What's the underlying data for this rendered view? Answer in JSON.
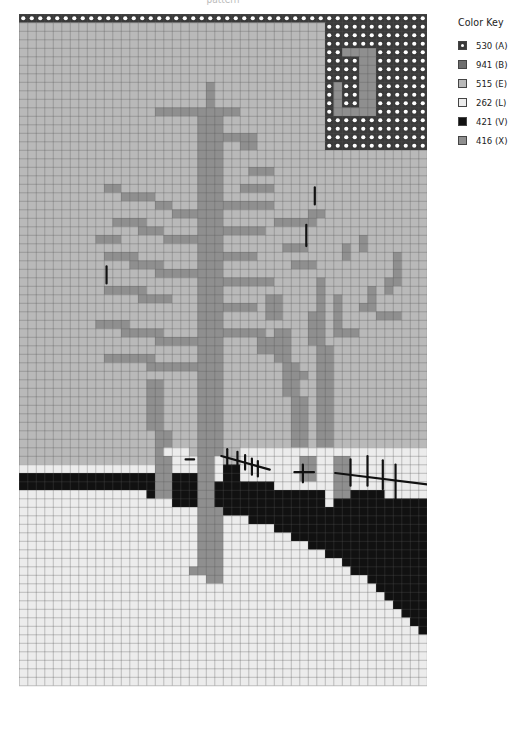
{
  "caption": "pattern",
  "legend": {
    "title": "Color Key",
    "items": [
      {
        "code": "A",
        "label": "530 (A)",
        "color": "#3a3a3a",
        "dot": true
      },
      {
        "code": "B",
        "label": "941 (B)",
        "color": "#6e6e6e",
        "dot": false
      },
      {
        "code": "E",
        "label": "515 (E)",
        "color": "#b9b9b9",
        "dot": false
      },
      {
        "code": "L",
        "label": "262 (L)",
        "color": "#ececec",
        "dot": false
      },
      {
        "code": "V",
        "label": "421 (V)",
        "color": "#111111",
        "dot": false
      },
      {
        "code": "X",
        "label": "416 (X)",
        "color": "#8f8f8f",
        "dot": false
      }
    ]
  },
  "grid": {
    "cols": 48,
    "rows": 79,
    "cell": 8.5,
    "gridline_color": "#555555",
    "background_code": "E",
    "rects": [
      {
        "code": "A",
        "x": 0,
        "y": 0,
        "w": 48,
        "h": 1
      },
      {
        "code": "A",
        "x": 36,
        "y": 0,
        "w": 12,
        "h": 16
      },
      {
        "code": "X",
        "x": 40,
        "y": 4,
        "w": 2,
        "h": 8
      },
      {
        "code": "X",
        "x": 38,
        "y": 4,
        "w": 2,
        "h": 1
      },
      {
        "code": "X",
        "x": 37,
        "y": 8,
        "w": 1,
        "h": 4
      },
      {
        "code": "X",
        "x": 37,
        "y": 11,
        "w": 4,
        "h": 1
      },
      {
        "code": "X",
        "x": 22,
        "y": 8,
        "w": 1,
        "h": 2
      },
      {
        "code": "X",
        "x": 22,
        "y": 10,
        "w": 1,
        "h": 2
      },
      {
        "code": "X",
        "x": 16,
        "y": 11,
        "w": 10,
        "h": 1
      },
      {
        "code": "X",
        "x": 21,
        "y": 12,
        "w": 2,
        "h": 60
      },
      {
        "code": "X",
        "x": 23,
        "y": 12,
        "w": 1,
        "h": 50
      },
      {
        "code": "X",
        "x": 10,
        "y": 20,
        "w": 2,
        "h": 1
      },
      {
        "code": "X",
        "x": 12,
        "y": 21,
        "w": 4,
        "h": 1
      },
      {
        "code": "X",
        "x": 16,
        "y": 22,
        "w": 2,
        "h": 1
      },
      {
        "code": "X",
        "x": 18,
        "y": 23,
        "w": 3,
        "h": 1
      },
      {
        "code": "X",
        "x": 11,
        "y": 24,
        "w": 4,
        "h": 1
      },
      {
        "code": "X",
        "x": 14,
        "y": 25,
        "w": 3,
        "h": 1
      },
      {
        "code": "X",
        "x": 17,
        "y": 26,
        "w": 4,
        "h": 1
      },
      {
        "code": "X",
        "x": 9,
        "y": 26,
        "w": 3,
        "h": 1
      },
      {
        "code": "X",
        "x": 10,
        "y": 28,
        "w": 4,
        "h": 1
      },
      {
        "code": "X",
        "x": 13,
        "y": 29,
        "w": 4,
        "h": 1
      },
      {
        "code": "X",
        "x": 16,
        "y": 30,
        "w": 5,
        "h": 1
      },
      {
        "code": "X",
        "x": 10,
        "y": 32,
        "w": 5,
        "h": 1
      },
      {
        "code": "X",
        "x": 14,
        "y": 33,
        "w": 4,
        "h": 1
      },
      {
        "code": "X",
        "x": 9,
        "y": 36,
        "w": 4,
        "h": 1
      },
      {
        "code": "X",
        "x": 12,
        "y": 37,
        "w": 5,
        "h": 1
      },
      {
        "code": "X",
        "x": 16,
        "y": 38,
        "w": 5,
        "h": 1
      },
      {
        "code": "X",
        "x": 10,
        "y": 40,
        "w": 6,
        "h": 1
      },
      {
        "code": "X",
        "x": 15,
        "y": 41,
        "w": 6,
        "h": 1
      },
      {
        "code": "X",
        "x": 15,
        "y": 43,
        "w": 2,
        "h": 6
      },
      {
        "code": "X",
        "x": 16,
        "y": 49,
        "w": 2,
        "h": 3
      },
      {
        "code": "X",
        "x": 24,
        "y": 14,
        "w": 4,
        "h": 1
      },
      {
        "code": "X",
        "x": 26,
        "y": 15,
        "w": 2,
        "h": 1
      },
      {
        "code": "X",
        "x": 27,
        "y": 18,
        "w": 3,
        "h": 1
      },
      {
        "code": "X",
        "x": 26,
        "y": 20,
        "w": 4,
        "h": 1
      },
      {
        "code": "X",
        "x": 24,
        "y": 22,
        "w": 6,
        "h": 1
      },
      {
        "code": "X",
        "x": 24,
        "y": 25,
        "w": 5,
        "h": 1
      },
      {
        "code": "X",
        "x": 24,
        "y": 28,
        "w": 4,
        "h": 1
      },
      {
        "code": "X",
        "x": 24,
        "y": 31,
        "w": 6,
        "h": 1
      },
      {
        "code": "X",
        "x": 24,
        "y": 34,
        "w": 4,
        "h": 1
      },
      {
        "code": "X",
        "x": 24,
        "y": 37,
        "w": 5,
        "h": 1
      },
      {
        "code": "X",
        "x": 30,
        "y": 24,
        "w": 5,
        "h": 1
      },
      {
        "code": "X",
        "x": 34,
        "y": 23,
        "w": 2,
        "h": 1
      },
      {
        "code": "X",
        "x": 31,
        "y": 27,
        "w": 3,
        "h": 1
      },
      {
        "code": "X",
        "x": 32,
        "y": 29,
        "w": 3,
        "h": 1
      },
      {
        "code": "X",
        "x": 30,
        "y": 37,
        "w": 2,
        "h": 4
      },
      {
        "code": "X",
        "x": 31,
        "y": 41,
        "w": 2,
        "h": 4
      },
      {
        "code": "X",
        "x": 32,
        "y": 45,
        "w": 2,
        "h": 13
      },
      {
        "code": "X",
        "x": 35,
        "y": 31,
        "w": 1,
        "h": 4
      },
      {
        "code": "X",
        "x": 34,
        "y": 35,
        "w": 2,
        "h": 4
      },
      {
        "code": "X",
        "x": 35,
        "y": 39,
        "w": 2,
        "h": 5
      },
      {
        "code": "X",
        "x": 35,
        "y": 44,
        "w": 2,
        "h": 14
      },
      {
        "code": "X",
        "x": 37,
        "y": 33,
        "w": 1,
        "h": 5
      },
      {
        "code": "X",
        "x": 38,
        "y": 37,
        "w": 2,
        "h": 1
      },
      {
        "code": "X",
        "x": 40,
        "y": 34,
        "w": 2,
        "h": 1
      },
      {
        "code": "X",
        "x": 41,
        "y": 32,
        "w": 1,
        "h": 2
      },
      {
        "code": "X",
        "x": 44,
        "y": 28,
        "w": 1,
        "h": 4
      },
      {
        "code": "X",
        "x": 43,
        "y": 31,
        "w": 1,
        "h": 2
      },
      {
        "code": "X",
        "x": 38,
        "y": 27,
        "w": 1,
        "h": 2
      },
      {
        "code": "X",
        "x": 40,
        "y": 26,
        "w": 1,
        "h": 2
      },
      {
        "code": "X",
        "x": 42,
        "y": 35,
        "w": 3,
        "h": 1
      },
      {
        "code": "X",
        "x": 28,
        "y": 38,
        "w": 2,
        "h": 2
      },
      {
        "code": "X",
        "x": 29,
        "y": 33,
        "w": 2,
        "h": 3
      },
      {
        "code": "X",
        "x": 32,
        "y": 42,
        "w": 2,
        "h": 1
      },
      {
        "code": "L",
        "x": 0,
        "y": 53,
        "w": 48,
        "h": 26
      },
      {
        "code": "L",
        "x": 17,
        "y": 51,
        "w": 3,
        "h": 2
      },
      {
        "code": "L",
        "x": 20,
        "y": 52,
        "w": 4,
        "h": 1
      },
      {
        "code": "L",
        "x": 26,
        "y": 51,
        "w": 22,
        "h": 2
      },
      {
        "code": "V",
        "x": 0,
        "y": 54,
        "w": 16,
        "h": 2
      },
      {
        "code": "V",
        "x": 15,
        "y": 56,
        "w": 2,
        "h": 1
      },
      {
        "code": "V",
        "x": 18,
        "y": 54,
        "w": 3,
        "h": 4
      },
      {
        "code": "V",
        "x": 24,
        "y": 53,
        "w": 2,
        "h": 2
      },
      {
        "code": "V",
        "x": 23,
        "y": 55,
        "w": 7,
        "h": 3
      },
      {
        "code": "V",
        "x": 24,
        "y": 58,
        "w": 24,
        "h": 1
      },
      {
        "code": "V",
        "x": 26,
        "y": 57,
        "w": 6,
        "h": 1
      },
      {
        "code": "V",
        "x": 30,
        "y": 56,
        "w": 6,
        "h": 2
      },
      {
        "code": "V",
        "x": 38,
        "y": 56,
        "w": 5,
        "h": 2
      },
      {
        "code": "V",
        "x": 37,
        "y": 57,
        "w": 11,
        "h": 1
      },
      {
        "code": "V",
        "x": 42,
        "y": 57,
        "w": 5,
        "h": 1
      },
      {
        "code": "V",
        "x": 27,
        "y": 59,
        "w": 21,
        "h": 1
      },
      {
        "code": "V",
        "x": 30,
        "y": 60,
        "w": 18,
        "h": 1
      },
      {
        "code": "V",
        "x": 32,
        "y": 61,
        "w": 16,
        "h": 1
      },
      {
        "code": "V",
        "x": 34,
        "y": 62,
        "w": 14,
        "h": 1
      },
      {
        "code": "V",
        "x": 36,
        "y": 63,
        "w": 12,
        "h": 1
      },
      {
        "code": "V",
        "x": 38,
        "y": 64,
        "w": 10,
        "h": 1
      },
      {
        "code": "V",
        "x": 39,
        "y": 65,
        "w": 9,
        "h": 1
      },
      {
        "code": "V",
        "x": 41,
        "y": 66,
        "w": 7,
        "h": 1
      },
      {
        "code": "V",
        "x": 42,
        "y": 67,
        "w": 6,
        "h": 1
      },
      {
        "code": "V",
        "x": 43,
        "y": 68,
        "w": 5,
        "h": 1
      },
      {
        "code": "V",
        "x": 44,
        "y": 69,
        "w": 4,
        "h": 1
      },
      {
        "code": "V",
        "x": 45,
        "y": 70,
        "w": 3,
        "h": 1
      },
      {
        "code": "V",
        "x": 46,
        "y": 71,
        "w": 2,
        "h": 1
      },
      {
        "code": "V",
        "x": 47,
        "y": 72,
        "w": 1,
        "h": 1
      },
      {
        "code": "X",
        "x": 16,
        "y": 52,
        "w": 2,
        "h": 5
      },
      {
        "code": "X",
        "x": 21,
        "y": 52,
        "w": 2,
        "h": 14
      },
      {
        "code": "X",
        "x": 22,
        "y": 58,
        "w": 2,
        "h": 8
      },
      {
        "code": "X",
        "x": 20,
        "y": 65,
        "w": 4,
        "h": 1
      },
      {
        "code": "X",
        "x": 22,
        "y": 66,
        "w": 2,
        "h": 1
      },
      {
        "code": "X",
        "x": 33,
        "y": 52,
        "w": 2,
        "h": 3
      },
      {
        "code": "X",
        "x": 37,
        "y": 52,
        "w": 2,
        "h": 5
      }
    ],
    "backstitch": [
      {
        "x1": 19.6,
        "y1": 52.4,
        "x2": 20.6,
        "y2": 52.4
      },
      {
        "x1": 23.8,
        "y1": 52.0,
        "x2": 29.5,
        "y2": 53.6
      },
      {
        "x1": 24.5,
        "y1": 51.2,
        "x2": 24.5,
        "y2": 53.7
      },
      {
        "x1": 25.7,
        "y1": 51.5,
        "x2": 25.7,
        "y2": 53.6
      },
      {
        "x1": 26.6,
        "y1": 51.9,
        "x2": 26.6,
        "y2": 53.6
      },
      {
        "x1": 27.4,
        "y1": 52.3,
        "x2": 27.4,
        "y2": 54.2
      },
      {
        "x1": 28.1,
        "y1": 52.6,
        "x2": 28.1,
        "y2": 54.4
      },
      {
        "x1": 32.4,
        "y1": 53.9,
        "x2": 34.7,
        "y2": 53.9
      },
      {
        "x1": 33.4,
        "y1": 53.0,
        "x2": 33.4,
        "y2": 55.1
      },
      {
        "x1": 37.2,
        "y1": 54.0,
        "x2": 48.4,
        "y2": 55.4
      },
      {
        "x1": 39.0,
        "y1": 52.4,
        "x2": 39.0,
        "y2": 55.5
      },
      {
        "x1": 41.0,
        "y1": 52.0,
        "x2": 41.0,
        "y2": 55.5
      },
      {
        "x1": 42.8,
        "y1": 52.5,
        "x2": 42.8,
        "y2": 55.9
      },
      {
        "x1": 44.3,
        "y1": 53.0,
        "x2": 44.3,
        "y2": 57.3
      },
      {
        "x1": 10.3,
        "y1": 29.7,
        "x2": 10.3,
        "y2": 31.7
      },
      {
        "x1": 34.8,
        "y1": 20.4,
        "x2": 34.8,
        "y2": 22.4
      },
      {
        "x1": 33.8,
        "y1": 24.8,
        "x2": 33.8,
        "y2": 27.3
      }
    ]
  }
}
